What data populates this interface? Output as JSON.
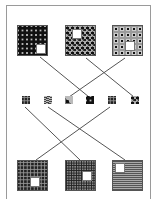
{
  "diagram": {
    "type": "pattern-completion-matching",
    "top_squares": [
      {
        "id": "top-1",
        "pattern": "diamond-lattice",
        "hole": "bottom-right"
      },
      {
        "id": "top-2",
        "pattern": "scattered-dots",
        "hole": "top-left"
      },
      {
        "id": "top-3",
        "pattern": "ringed-dots",
        "hole": "center-bottom"
      }
    ],
    "candidate_patches": [
      {
        "id": "patch-1",
        "pattern": "brick-grid"
      },
      {
        "id": "patch-2",
        "pattern": "wavy-lines"
      },
      {
        "id": "patch-3",
        "pattern": "mixed-dot"
      },
      {
        "id": "patch-4",
        "pattern": "diamond-lattice"
      },
      {
        "id": "patch-5",
        "pattern": "brick-grid-dark"
      },
      {
        "id": "patch-6",
        "pattern": "scattered-dots"
      }
    ],
    "bottom_squares": [
      {
        "id": "bottom-1",
        "pattern": "brick-grid-dark",
        "hole": "bottom-center"
      },
      {
        "id": "bottom-2",
        "pattern": "fine-grid",
        "hole": "center-right"
      },
      {
        "id": "bottom-3",
        "pattern": "wavy-lines",
        "hole": "top-left"
      }
    ],
    "connections": [
      {
        "from": "top-1",
        "to": "patch-4"
      },
      {
        "from": "top-2",
        "to": "patch-6"
      },
      {
        "from": "top-3",
        "to": "patch-3"
      },
      {
        "from": "bottom-1",
        "to": "patch-5"
      },
      {
        "from": "bottom-2",
        "to": "patch-1"
      },
      {
        "from": "bottom-3",
        "to": "patch-2"
      }
    ],
    "colors": {
      "line": "#555555",
      "frame": "#9a9a9a",
      "background": "#ffffff"
    }
  }
}
